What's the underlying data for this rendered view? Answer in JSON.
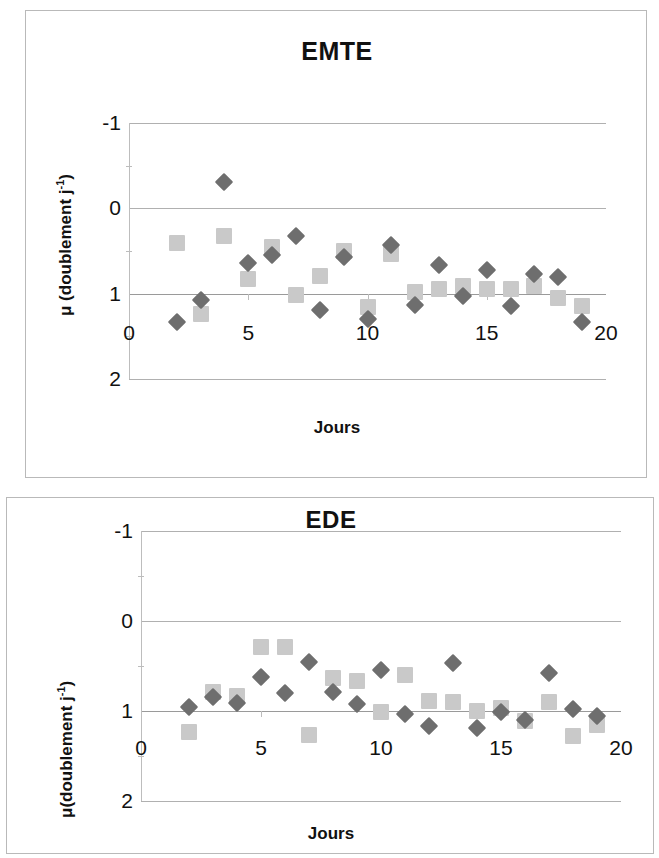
{
  "charts": [
    {
      "id": "emte",
      "title": "EMTE",
      "xlabel": "Jours",
      "ylabel_html": "μ (doublement j-1)",
      "ylabel_main": "μ (doublement j",
      "ylabel_sup": "-1",
      "ylabel_tail": ")",
      "yticks": [
        "2",
        "1",
        "0",
        "-1"
      ],
      "xticks": [
        "0",
        "5",
        "10",
        "15",
        "20"
      ]
    },
    {
      "id": "ede",
      "title": "EDE",
      "xlabel": "Jours",
      "ylabel_html": "μ(doublement j-1)",
      "ylabel_main": "μ(doublement j",
      "ylabel_sup": "-1",
      "ylabel_tail": ")",
      "yticks": [
        "2",
        "1",
        "0",
        "-1"
      ],
      "xticks": [
        "0",
        "5",
        "10",
        "15",
        "20"
      ]
    }
  ],
  "colors": {
    "diamond": "#6e6e6e",
    "square": "#c9c9c9",
    "gridline": "#b0b0b0",
    "axis": "#b5b5b5",
    "text": "#111111",
    "panel_border": "#b9b9b9"
  },
  "chart_data": [
    {
      "type": "scatter",
      "title": "EMTE",
      "xlabel": "Jours",
      "ylabel": "μ (doublement j-1)",
      "xlim": [
        0,
        20
      ],
      "ylim": [
        -1,
        2
      ],
      "xticks": [
        0,
        5,
        10,
        15,
        20
      ],
      "yticks": [
        -1,
        0,
        1,
        2
      ],
      "grid": true,
      "legend": "none",
      "series": [
        {
          "name": "diamonds",
          "marker": "diamond",
          "color": "#6e6e6e",
          "points": [
            {
              "x": 2,
              "y": -0.33
            },
            {
              "x": 3,
              "y": -0.08
            },
            {
              "x": 4,
              "y": 1.31
            },
            {
              "x": 5,
              "y": 0.36
            },
            {
              "x": 6,
              "y": 0.45
            },
            {
              "x": 7,
              "y": 0.67
            },
            {
              "x": 8,
              "y": -0.19
            },
            {
              "x": 9,
              "y": 0.43
            },
            {
              "x": 10,
              "y": -0.3
            },
            {
              "x": 11,
              "y": 0.57
            },
            {
              "x": 12,
              "y": -0.13
            },
            {
              "x": 13,
              "y": 0.34
            },
            {
              "x": 14,
              "y": -0.03
            },
            {
              "x": 15,
              "y": 0.28
            },
            {
              "x": 16,
              "y": -0.15
            },
            {
              "x": 17,
              "y": 0.23
            },
            {
              "x": 18,
              "y": 0.19
            },
            {
              "x": 19,
              "y": -0.33
            }
          ]
        },
        {
          "name": "squares",
          "marker": "square",
          "color": "#c9c9c9",
          "points": [
            {
              "x": 2,
              "y": 0.59
            },
            {
              "x": 3,
              "y": -0.24
            },
            {
              "x": 4,
              "y": 0.68
            },
            {
              "x": 5,
              "y": 0.17
            },
            {
              "x": 6,
              "y": 0.55
            },
            {
              "x": 7,
              "y": -0.01
            },
            {
              "x": 8,
              "y": 0.21
            },
            {
              "x": 9,
              "y": 0.5
            },
            {
              "x": 10,
              "y": -0.16
            },
            {
              "x": 11,
              "y": 0.47
            },
            {
              "x": 12,
              "y": 0.02
            },
            {
              "x": 13,
              "y": 0.05
            },
            {
              "x": 14,
              "y": 0.09
            },
            {
              "x": 15,
              "y": 0.06
            },
            {
              "x": 16,
              "y": 0.06
            },
            {
              "x": 17,
              "y": 0.09
            },
            {
              "x": 18,
              "y": -0.05
            },
            {
              "x": 19,
              "y": -0.14
            }
          ]
        }
      ]
    },
    {
      "type": "scatter",
      "title": "EDE",
      "xlabel": "Jours",
      "ylabel": "μ(doublement j-1)",
      "xlim": [
        0,
        20
      ],
      "ylim": [
        -1,
        2
      ],
      "xticks": [
        0,
        5,
        10,
        15,
        20
      ],
      "yticks": [
        -1,
        0,
        1,
        2
      ],
      "grid": true,
      "legend": "none",
      "series": [
        {
          "name": "diamonds",
          "marker": "diamond",
          "color": "#6e6e6e",
          "points": [
            {
              "x": 2,
              "y": 0.04
            },
            {
              "x": 3,
              "y": 0.16
            },
            {
              "x": 4,
              "y": 0.09
            },
            {
              "x": 5,
              "y": 0.38
            },
            {
              "x": 6,
              "y": 0.2
            },
            {
              "x": 7,
              "y": 0.54
            },
            {
              "x": 8,
              "y": 0.21
            },
            {
              "x": 9,
              "y": 0.08
            },
            {
              "x": 10,
              "y": 0.46
            },
            {
              "x": 11,
              "y": -0.03
            },
            {
              "x": 12,
              "y": -0.17
            },
            {
              "x": 13,
              "y": 0.53
            },
            {
              "x": 14,
              "y": -0.19
            },
            {
              "x": 15,
              "y": -0.01
            },
            {
              "x": 16,
              "y": -0.1
            },
            {
              "x": 17,
              "y": 0.42
            },
            {
              "x": 18,
              "y": 0.02
            },
            {
              "x": 19,
              "y": -0.06
            }
          ]
        },
        {
          "name": "squares",
          "marker": "square",
          "color": "#c9c9c9",
          "points": [
            {
              "x": 2,
              "y": -0.23
            },
            {
              "x": 3,
              "y": 0.21
            },
            {
              "x": 4,
              "y": 0.17
            },
            {
              "x": 5,
              "y": 0.71
            },
            {
              "x": 6,
              "y": 0.71
            },
            {
              "x": 7,
              "y": -0.27
            },
            {
              "x": 8,
              "y": 0.37
            },
            {
              "x": 9,
              "y": 0.33
            },
            {
              "x": 10,
              "y": -0.01
            },
            {
              "x": 11,
              "y": 0.4
            },
            {
              "x": 12,
              "y": 0.11
            },
            {
              "x": 13,
              "y": 0.1
            },
            {
              "x": 14,
              "y": 0.0
            },
            {
              "x": 15,
              "y": 0.03
            },
            {
              "x": 16,
              "y": -0.11
            },
            {
              "x": 17,
              "y": 0.1
            },
            {
              "x": 18,
              "y": -0.28
            },
            {
              "x": 19,
              "y": -0.16
            }
          ]
        }
      ]
    }
  ]
}
